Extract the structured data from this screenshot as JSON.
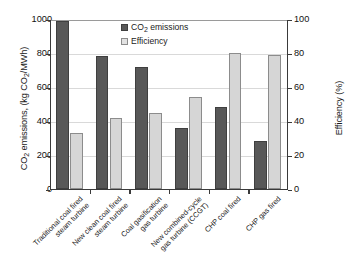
{
  "chart_data": {
    "type": "bar",
    "title": "",
    "subtitle": "",
    "categories": [
      "Traditional coal fired steam turbine",
      "New clean coal fired steam turbine",
      "Coal gasification gas turbine",
      "New combined-cycle gas turbine (CCGT)",
      "CHP coal fired",
      "CHP gas fired"
    ],
    "category_lines": [
      [
        "Traditional coal fired",
        "steam turbine"
      ],
      [
        "New clean coal fired",
        "steam turbine"
      ],
      [
        "Coal gasification",
        "gas turbine"
      ],
      [
        "New combined-cycle",
        "gas turbine (CCGT)"
      ],
      [
        "CHP coal fired"
      ],
      [
        "CHP gas fired"
      ]
    ],
    "series": [
      {
        "name": "CO2 emissions",
        "label": "CO₂ emissions",
        "axis": "left",
        "unit": "kg CO2/MWh",
        "color": "#585858",
        "values": [
          990,
          780,
          715,
          360,
          485,
          285
        ]
      },
      {
        "name": "Efficiency",
        "label": "Efficiency",
        "axis": "right",
        "unit": "%",
        "color": "#d6d6d6",
        "values": [
          33,
          42,
          45,
          54,
          80,
          79
        ]
      }
    ],
    "xlabel": "",
    "ylabel": "CO2 emissions, (kg CO2/MWh)",
    "ylabel_right": "Efficiency (%)",
    "ylim": [
      0,
      1000
    ],
    "ylim_right": [
      0,
      100
    ],
    "yticks": [
      0,
      200,
      400,
      600,
      800,
      1000
    ],
    "yticks_right": [
      0,
      20,
      40,
      60,
      80,
      100
    ],
    "grid": true,
    "legend_position": "top-center"
  },
  "axes": {
    "left_title_pre": "CO",
    "left_title_sub1": "2",
    "left_title_mid": " emissions, (kg CO",
    "left_title_sub2": "2",
    "left_title_post": "/MWh)",
    "right_title": "Efficiency (%)"
  },
  "legend": {
    "items": [
      {
        "label_pre": "CO",
        "label_sub": "2",
        "label_post": " emissions"
      },
      {
        "label_pre": "Efficiency",
        "label_sub": "",
        "label_post": ""
      }
    ]
  }
}
